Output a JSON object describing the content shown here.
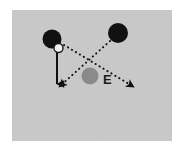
{
  "figure": {
    "panel": {
      "background_color": "#c9c9c9",
      "page_background_color": "#ffffff",
      "x": 12,
      "y": 10,
      "width": 160,
      "height": 131
    },
    "labels": [
      {
        "name": "field-point-label",
        "text": "E",
        "x": 103,
        "y": 84,
        "color": "#1a1a1a"
      }
    ],
    "bodies": [
      {
        "name": "charge-upper-left",
        "shape": "filled-circle",
        "cx": 52,
        "cy": 39,
        "r": 9.5,
        "fill": "#111111",
        "stroke": "none"
      },
      {
        "name": "charge-upper-right",
        "shape": "filled-circle",
        "cx": 118,
        "cy": 33,
        "r": 10,
        "fill": "#111111",
        "stroke": "none"
      },
      {
        "name": "field-point-marker",
        "shape": "filled-circle",
        "cx": 90,
        "cy": 76,
        "r": 8.5,
        "fill": "#8a8a8a",
        "stroke": "none"
      },
      {
        "name": "origin-hollow-circle",
        "shape": "hollow-circle",
        "cx": 58.5,
        "cy": 48,
        "r": 4.5,
        "fill": "#f2f2f2",
        "stroke": "#1a1a1a"
      }
    ],
    "vectors": [
      {
        "name": "resultant-vector-down",
        "style": "solid",
        "x1": 57,
        "y1": 51,
        "x2": 57,
        "y2": 84,
        "color": "#111111",
        "width": 2.0,
        "arrowhead": "filled-triangle"
      },
      {
        "name": "field-vector-from-left-charge",
        "style": "dotted",
        "x1": 64,
        "y1": 45,
        "x2": 134,
        "y2": 87,
        "color": "#111111",
        "width": 2.0,
        "arrowhead": "filled-triangle"
      },
      {
        "name": "field-vector-from-right-charge",
        "style": "dotted",
        "x1": 110,
        "y1": 41,
        "x2": 59,
        "y2": 87,
        "color": "#111111",
        "width": 2.0,
        "arrowhead": "filled-triangle"
      }
    ]
  }
}
